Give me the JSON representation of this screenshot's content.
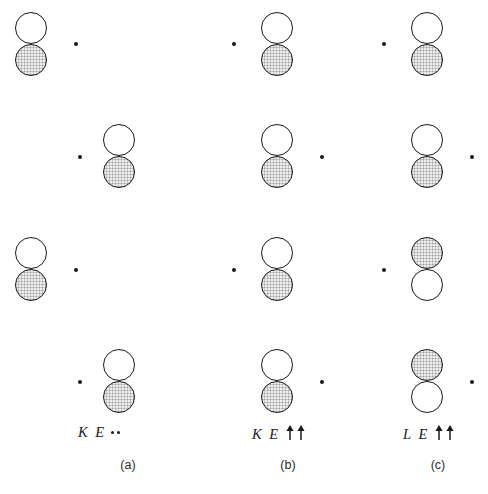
{
  "figure": {
    "rows": 4,
    "panels": [
      {
        "id": "a",
        "caption": "(a)",
        "caption_x": 108,
        "label": {
          "letter1": "K",
          "letter2": "E",
          "spin_type": "dots",
          "spin_symbols": [
            "•",
            "•"
          ],
          "x": 78,
          "y": 424
        },
        "rows": [
          {
            "index": 1,
            "orbital_x": 15,
            "orbital_y": 12,
            "top_lobe": "white",
            "bottom_lobe": "gray",
            "dot_x": 74,
            "dot_y": 42
          },
          {
            "index": 2,
            "orbital_x": 103,
            "orbital_y": 124,
            "top_lobe": "white",
            "bottom_lobe": "gray",
            "dot_x": 78,
            "dot_y": 155
          },
          {
            "index": 3,
            "orbital_x": 15,
            "orbital_y": 237,
            "top_lobe": "white",
            "bottom_lobe": "gray",
            "dot_x": 74,
            "dot_y": 268
          },
          {
            "index": 4,
            "orbital_x": 103,
            "orbital_y": 349,
            "top_lobe": "white",
            "bottom_lobe": "gray",
            "dot_x": 78,
            "dot_y": 380
          }
        ]
      },
      {
        "id": "b",
        "caption": "(b)",
        "caption_x": 268,
        "label": {
          "letter1": "K",
          "letter2": "E",
          "spin_type": "arrows",
          "spin_symbols": [
            "↑",
            "↑"
          ],
          "x": 252,
          "y": 424
        },
        "rows": [
          {
            "index": 1,
            "orbital_x": 261,
            "orbital_y": 12,
            "top_lobe": "white",
            "bottom_lobe": "gray",
            "dot_x": 232,
            "dot_y": 42
          },
          {
            "index": 2,
            "orbital_x": 261,
            "orbital_y": 124,
            "top_lobe": "white",
            "bottom_lobe": "gray",
            "dot_x": 320,
            "dot_y": 155
          },
          {
            "index": 3,
            "orbital_x": 261,
            "orbital_y": 237,
            "top_lobe": "white",
            "bottom_lobe": "gray",
            "dot_x": 232,
            "dot_y": 268
          },
          {
            "index": 4,
            "orbital_x": 261,
            "orbital_y": 349,
            "top_lobe": "white",
            "bottom_lobe": "gray",
            "dot_x": 320,
            "dot_y": 380
          }
        ]
      },
      {
        "id": "c",
        "caption": "(c)",
        "caption_x": 418,
        "label": {
          "letter1": "L",
          "letter2": "E",
          "spin_type": "arrows",
          "spin_symbols": [
            "↑",
            "↑"
          ],
          "x": 403,
          "y": 424
        },
        "rows": [
          {
            "index": 1,
            "orbital_x": 411,
            "orbital_y": 12,
            "top_lobe": "white",
            "bottom_lobe": "gray",
            "dot_x": 382,
            "dot_y": 42
          },
          {
            "index": 2,
            "orbital_x": 411,
            "orbital_y": 124,
            "top_lobe": "white",
            "bottom_lobe": "gray",
            "dot_x": 470,
            "dot_y": 155
          },
          {
            "index": 3,
            "orbital_x": 411,
            "orbital_y": 237,
            "top_lobe": "gray",
            "bottom_lobe": "white",
            "dot_x": 382,
            "dot_y": 268
          },
          {
            "index": 4,
            "orbital_x": 411,
            "orbital_y": 349,
            "top_lobe": "gray",
            "bottom_lobe": "white",
            "dot_x": 470,
            "dot_y": 380
          }
        ]
      }
    ]
  },
  "colors": {
    "stroke": "#1a1a1a",
    "lobe_white_fill": "#ffffff",
    "lobe_gray_fill": "#c6c6c6",
    "background": "#ffffff",
    "text": "#1a1a1a"
  }
}
